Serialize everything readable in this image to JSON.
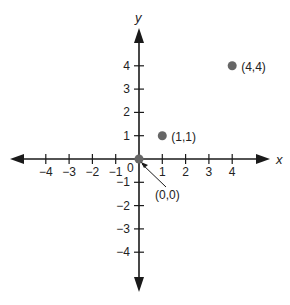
{
  "chart_data": {
    "type": "scatter",
    "title": "",
    "xlabel": "x",
    "ylabel": "y",
    "xlim": [
      -5,
      5
    ],
    "ylim": [
      -5,
      5
    ],
    "x_ticks": [
      -4,
      -3,
      -2,
      -1,
      1,
      2,
      3,
      4
    ],
    "y_ticks": [
      -4,
      -3,
      -2,
      -1,
      1,
      2,
      3,
      4
    ],
    "origin_label": "0",
    "grid": false,
    "points": [
      {
        "x": 0,
        "y": 0,
        "label": "(0,0)"
      },
      {
        "x": 1,
        "y": 1,
        "label": "(1,1)"
      },
      {
        "x": 4,
        "y": 4,
        "label": "(4,4)"
      }
    ]
  },
  "style": {
    "axis_color": "#1a1a1a",
    "point_color": "#666666"
  }
}
